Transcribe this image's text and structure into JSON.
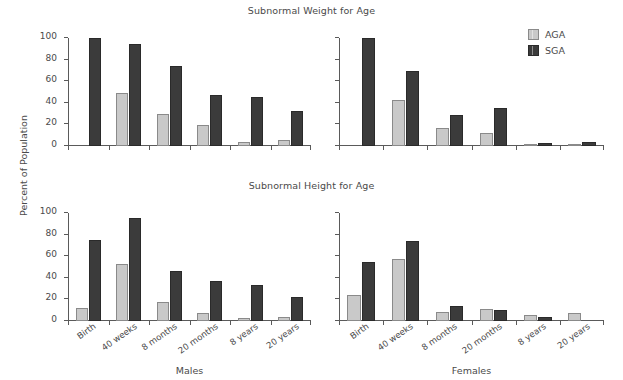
{
  "figure": {
    "ylabel": "Percent of Population",
    "legend": {
      "position": "top-right",
      "entries": [
        {
          "key": "AGA",
          "label": "AGA",
          "color": "#c9c9c9"
        },
        {
          "key": "SGA",
          "label": "SGA",
          "color": "#3b3b3b"
        }
      ]
    }
  },
  "chart_data": [
    {
      "id": "weight-males",
      "type": "bar",
      "title": "Subnormal Weight for Age",
      "xlabel": "Males",
      "ylabel": "Percent of Population",
      "ylim": [
        0,
        100
      ],
      "yticks": [
        0,
        20,
        40,
        60,
        80,
        100
      ],
      "grid": false,
      "categories": [
        "Birth",
        "40 weeks",
        "8 months",
        "20 months",
        "8 years",
        "20 years"
      ],
      "series": [
        {
          "name": "AGA",
          "color": "#c9c9c9",
          "values": [
            0,
            49,
            30,
            19,
            4,
            6
          ]
        },
        {
          "name": "SGA",
          "color": "#3b3b3b",
          "values": [
            100,
            94,
            74,
            47,
            45,
            32
          ]
        }
      ]
    },
    {
      "id": "weight-females",
      "type": "bar",
      "title": "Subnormal Weight for Age",
      "xlabel": "Females",
      "ylabel": "Percent of Population",
      "ylim": [
        0,
        100
      ],
      "yticks": [
        0,
        20,
        40,
        60,
        80,
        100
      ],
      "grid": false,
      "categories": [
        "Birth",
        "40 weeks",
        "8 months",
        "20 months",
        "8 years",
        "20 years"
      ],
      "series": [
        {
          "name": "AGA",
          "color": "#c9c9c9",
          "values": [
            0,
            43,
            17,
            12,
            1,
            1
          ]
        },
        {
          "name": "SGA",
          "color": "#3b3b3b",
          "values": [
            100,
            69,
            29,
            35,
            3,
            4
          ]
        }
      ]
    },
    {
      "id": "height-males",
      "type": "bar",
      "title": "Subnormal Height for Age",
      "xlabel": "Males",
      "ylabel": "Percent of Population",
      "ylim": [
        0,
        100
      ],
      "yticks": [
        0,
        20,
        40,
        60,
        80,
        100
      ],
      "grid": false,
      "categories": [
        "Birth",
        "40 weeks",
        "8 months",
        "20 months",
        "8 years",
        "20 years"
      ],
      "series": [
        {
          "name": "AGA",
          "color": "#c9c9c9",
          "values": [
            12,
            53,
            18,
            7,
            3,
            4
          ]
        },
        {
          "name": "SGA",
          "color": "#3b3b3b",
          "values": [
            75,
            95,
            46,
            37,
            33,
            22
          ]
        }
      ]
    },
    {
      "id": "height-females",
      "type": "bar",
      "title": "Subnormal Height for Age",
      "xlabel": "Females",
      "ylabel": "Percent of Population",
      "ylim": [
        0,
        100
      ],
      "yticks": [
        0,
        20,
        40,
        60,
        80,
        100
      ],
      "grid": false,
      "categories": [
        "Birth",
        "40 weeks",
        "8 months",
        "20 months",
        "8 years",
        "20 years"
      ],
      "series": [
        {
          "name": "AGA",
          "color": "#c9c9c9",
          "values": [
            24,
            57,
            8,
            11,
            6,
            7
          ]
        },
        {
          "name": "SGA",
          "color": "#3b3b3b",
          "values": [
            55,
            74,
            14,
            10,
            4,
            0
          ]
        }
      ]
    }
  ]
}
